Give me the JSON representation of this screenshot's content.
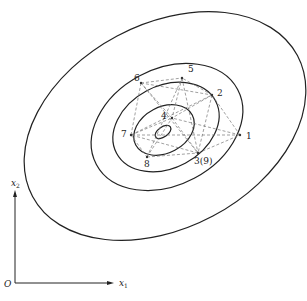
{
  "figure": {
    "axes": {
      "origin_label": "O",
      "x_label": "x",
      "x_sub": "1",
      "y_label": "x",
      "y_sub": "2"
    },
    "points": [
      {
        "id": "1",
        "label": "1"
      },
      {
        "id": "2",
        "label": "2"
      },
      {
        "id": "3",
        "label": "3(9)"
      },
      {
        "id": "4",
        "label": "4"
      },
      {
        "id": "5",
        "label": "5"
      },
      {
        "id": "6",
        "label": "6"
      },
      {
        "id": "7",
        "label": "7"
      },
      {
        "id": "8",
        "label": "8"
      }
    ],
    "contour_count": 5,
    "edges": [
      [
        "1",
        "2"
      ],
      [
        "2",
        "3"
      ],
      [
        "3",
        "1"
      ],
      [
        "2",
        "4"
      ],
      [
        "4",
        "3"
      ],
      [
        "2",
        "5"
      ],
      [
        "5",
        "4"
      ],
      [
        "4",
        "6"
      ],
      [
        "6",
        "5"
      ],
      [
        "6",
        "7"
      ],
      [
        "7",
        "4"
      ],
      [
        "7",
        "8"
      ],
      [
        "8",
        "4"
      ],
      [
        "8",
        "3"
      ],
      [
        "3",
        "7"
      ],
      [
        "1",
        "4"
      ],
      [
        "5",
        "3"
      ],
      [
        "6",
        "2"
      ],
      [
        "7",
        "2"
      ],
      [
        "8",
        "5"
      ],
      [
        "6",
        "3"
      ],
      [
        "1",
        "7"
      ]
    ]
  }
}
